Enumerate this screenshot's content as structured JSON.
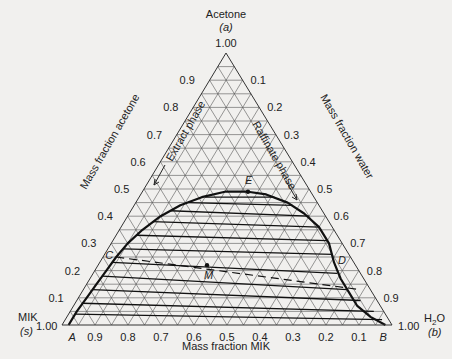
{
  "chart_data": {
    "type": "ternary",
    "title": "",
    "vertices": {
      "top": {
        "name": "Acetone",
        "symbol": "(a)",
        "value": "1.00"
      },
      "left": {
        "name": "MIK",
        "symbol": "(s)",
        "value": "1.00"
      },
      "right": {
        "name": "H2O",
        "symbol": "(b)",
        "value": "1.00"
      }
    },
    "axes": {
      "left_edge": {
        "title": "Mass fraction acetone",
        "ticks": [
          "0.9",
          "0.8",
          "0.7",
          "0.6",
          "0.5",
          "0.4",
          "0.3",
          "0.2",
          "0.1"
        ]
      },
      "right_edge": {
        "title": "Mass fraction water",
        "ticks": [
          "0.1",
          "0.2",
          "0.3",
          "0.4",
          "0.5",
          "0.6",
          "0.7",
          "0.8",
          "0.9"
        ]
      },
      "bottom_edge": {
        "title": "Mass fraction MIK",
        "ticks": [
          "0.9",
          "0.8",
          "0.7",
          "0.6",
          "0.5",
          "0.4",
          "0.3",
          "0.2",
          "0.1"
        ]
      }
    },
    "grid": {
      "divisions": 20
    },
    "phase_labels": [
      "Extract phase",
      "Raffinate phase"
    ],
    "points": [
      {
        "label": "A",
        "acetone": 0.0,
        "water": 0.02
      },
      {
        "label": "B",
        "acetone": 0.0,
        "water": 0.98
      },
      {
        "label": "C",
        "acetone": 0.25,
        "water": 0.04
      },
      {
        "label": "D",
        "acetone": 0.23,
        "water": 0.71
      },
      {
        "label": "E",
        "acetone": 0.49,
        "water": 0.32
      },
      {
        "label": "M",
        "acetone": 0.22,
        "water": 0.33
      }
    ],
    "binodal_curve": [
      [
        0.0,
        0.02
      ],
      [
        0.05,
        0.02
      ],
      [
        0.1,
        0.025
      ],
      [
        0.15,
        0.03
      ],
      [
        0.2,
        0.035
      ],
      [
        0.25,
        0.04
      ],
      [
        0.3,
        0.05
      ],
      [
        0.35,
        0.07
      ],
      [
        0.4,
        0.1
      ],
      [
        0.44,
        0.14
      ],
      [
        0.47,
        0.19
      ],
      [
        0.49,
        0.25
      ],
      [
        0.49,
        0.32
      ],
      [
        0.48,
        0.38
      ],
      [
        0.45,
        0.46
      ],
      [
        0.41,
        0.53
      ],
      [
        0.36,
        0.6
      ],
      [
        0.3,
        0.66
      ],
      [
        0.23,
        0.71
      ],
      [
        0.17,
        0.76
      ],
      [
        0.12,
        0.81
      ],
      [
        0.07,
        0.86
      ],
      [
        0.03,
        0.92
      ],
      [
        0.0,
        0.98
      ]
    ],
    "tie_lines": [
      [
        [
          0.04,
          0.02
        ],
        [
          0.02,
          0.96
        ]
      ],
      [
        [
          0.08,
          0.022
        ],
        [
          0.05,
          0.92
        ]
      ],
      [
        [
          0.13,
          0.027
        ],
        [
          0.09,
          0.86
        ]
      ],
      [
        [
          0.18,
          0.033
        ],
        [
          0.13,
          0.8
        ]
      ],
      [
        [
          0.23,
          0.038
        ],
        [
          0.19,
          0.74
        ]
      ],
      [
        [
          0.28,
          0.046
        ],
        [
          0.26,
          0.69
        ]
      ],
      [
        [
          0.33,
          0.062
        ],
        [
          0.31,
          0.65
        ]
      ],
      [
        [
          0.38,
          0.085
        ],
        [
          0.36,
          0.6
        ]
      ],
      [
        [
          0.42,
          0.12
        ],
        [
          0.4,
          0.55
        ]
      ],
      [
        [
          0.45,
          0.16
        ],
        [
          0.44,
          0.48
        ]
      ],
      [
        [
          0.47,
          0.2
        ],
        [
          0.47,
          0.41
        ]
      ]
    ],
    "dashed_line": [
      [
        0.25,
        0.04
      ],
      [
        0.13,
        0.84
      ]
    ]
  },
  "bottom_title": "Mass fraction MIK"
}
